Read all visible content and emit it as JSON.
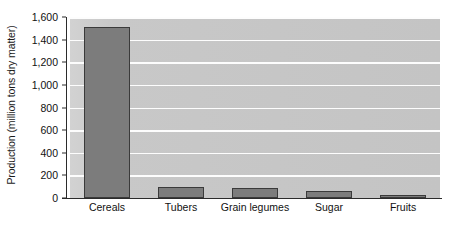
{
  "chart_data": {
    "type": "bar",
    "title": "",
    "xlabel": "",
    "ylabel": "Production (million tons dry matter)",
    "categories": [
      "Cereals",
      "Tubers",
      "Grain legumes",
      "Sugar",
      "Fruits"
    ],
    "values": [
      1510,
      100,
      90,
      65,
      30
    ],
    "series": [
      {
        "name": "Production",
        "values": [
          1510,
          100,
          90,
          65,
          30
        ]
      }
    ],
    "ylim": [
      0,
      1600
    ],
    "ytick_values": [
      0,
      200,
      400,
      600,
      800,
      1000,
      1200,
      1400,
      1600
    ],
    "ytick_labels": [
      "0",
      "200",
      "400",
      "600",
      "800",
      "1,000",
      "1,200",
      "1,400",
      "1,600"
    ],
    "grid": true,
    "grid_axis": "y",
    "grid_color": "#fdfdfd",
    "legend": false,
    "legend_position": "none",
    "plot_background": "#c8c8c8",
    "bar_fill_color": "#7c7c7c",
    "bar_edge_color": "#3a3a3a",
    "axis_color": "#2b2b2b",
    "text_color": "#111111"
  }
}
